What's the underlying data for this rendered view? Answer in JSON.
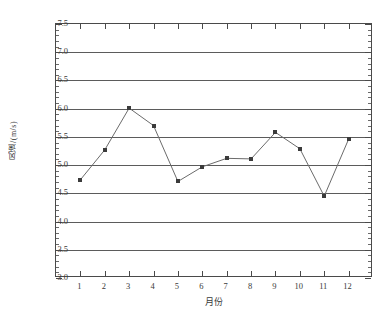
{
  "chart_data": {
    "type": "line",
    "title": "",
    "xlabel": "月份",
    "ylabel": "风速/(m/s)",
    "categories": [
      "1",
      "2",
      "3",
      "4",
      "5",
      "6",
      "7",
      "8",
      "9",
      "10",
      "11",
      "12"
    ],
    "x": [
      1,
      2,
      3,
      4,
      5,
      6,
      7,
      8,
      9,
      10,
      11,
      12
    ],
    "values": [
      4.74,
      5.27,
      6.01,
      5.7,
      4.71,
      4.97,
      5.12,
      5.11,
      5.58,
      5.29,
      4.45,
      5.46
    ],
    "series": [
      {
        "name": "风速",
        "values": [
          4.74,
          5.27,
          6.01,
          5.7,
          4.71,
          4.97,
          5.12,
          5.11,
          5.58,
          5.29,
          4.45,
          5.46
        ]
      }
    ],
    "ylim": [
      3.0,
      7.5
    ],
    "xlim": [
      0,
      13
    ],
    "ytick_labels": [
      "7.5",
      "7.0",
      "6.5",
      "6.0",
      "5.5",
      "5.0",
      "4.5",
      "4.0",
      "3.5",
      "3.0"
    ],
    "ytick_values": [
      7.5,
      7.0,
      6.5,
      6.0,
      5.5,
      5.0,
      4.5,
      4.0,
      3.5,
      3.0
    ],
    "ytick_step": 0.5,
    "yminor_step": 0.1,
    "grid": true,
    "grid_axis": "y",
    "legend": "none",
    "line_color": "#6b6b6b",
    "marker_color": "#3b3b3b",
    "marker_shape": "square",
    "axis_color": "#4a4a4a",
    "background_color": "#ffffff"
  }
}
